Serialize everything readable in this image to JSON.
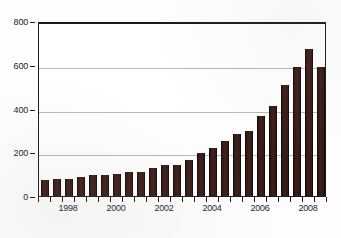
{
  "chart_data": {
    "type": "bar",
    "title": "",
    "subtitle": "",
    "xlabel": "",
    "ylabel": "",
    "ylim": [
      0,
      800
    ],
    "ytick_labels": [
      "0",
      "200",
      "400",
      "600",
      "800"
    ],
    "ytick_values": [
      0,
      200,
      400,
      600,
      800
    ],
    "xtick_labels": [
      "1998",
      "2000",
      "2002",
      "2004",
      "2006",
      "2008"
    ],
    "xtick_values": [
      1998,
      2000,
      2002,
      2004,
      2006,
      2008
    ],
    "grid": true,
    "legend": "none",
    "bar_color": "#331711",
    "gridline_color": "#b9b9b9",
    "axis_color": "#1a1a1a",
    "background_color": "#ffffff",
    "categories": [
      "1997.0",
      "1997.5",
      "1998.0",
      "1998.5",
      "1999.0",
      "1999.5",
      "2000.0",
      "2000.5",
      "2001.0",
      "2001.5",
      "2002.0",
      "2002.5",
      "2003.0",
      "2003.5",
      "2004.0",
      "2004.5",
      "2005.0",
      "2005.5",
      "2006.0",
      "2006.5",
      "2007.0",
      "2007.5",
      "2008.0",
      "2008.5"
    ],
    "values": [
      74,
      80,
      80,
      88,
      95,
      95,
      102,
      108,
      108,
      126,
      140,
      142,
      166,
      198,
      218,
      252,
      282,
      296,
      366,
      410,
      508,
      588,
      670,
      588
    ]
  }
}
